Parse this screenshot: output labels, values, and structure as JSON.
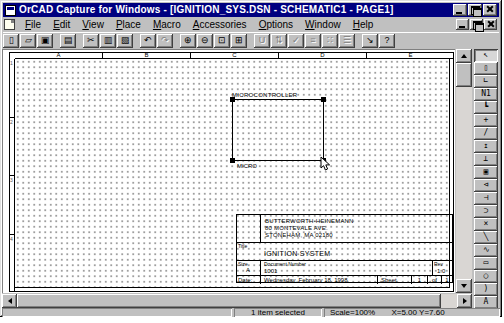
{
  "window": {
    "title": "OrCAD Capture for Windows - [IGNITION_SYS.DSN - SCHEMATIC1 - PAGE1]",
    "control_icons": [
      "minimize",
      "restore",
      "close"
    ]
  },
  "menu": {
    "items": [
      "File",
      "Edit",
      "View",
      "Place",
      "Macro",
      "Accessories",
      "Options",
      "Window",
      "Help"
    ]
  },
  "toolbar": {
    "buttons": [
      {
        "name": "new",
        "glyph": "▯",
        "enabled": true
      },
      {
        "name": "open",
        "glyph": "▱",
        "enabled": true
      },
      {
        "name": "save",
        "glyph": "▣",
        "enabled": true
      },
      {
        "name": "print",
        "glyph": "▤",
        "enabled": true
      },
      {
        "name": "cut",
        "glyph": "✂",
        "enabled": true
      },
      {
        "name": "copy",
        "glyph": "▥",
        "enabled": true
      },
      {
        "name": "paste",
        "glyph": "▧",
        "enabled": true
      },
      {
        "name": "undo",
        "glyph": "↶",
        "enabled": true
      },
      {
        "name": "redo",
        "glyph": "↷",
        "enabled": false
      },
      {
        "name": "zoom-in",
        "glyph": "⊕",
        "enabled": true
      },
      {
        "name": "zoom-out",
        "glyph": "⊖",
        "enabled": true
      },
      {
        "name": "zoom-area",
        "glyph": "⊡",
        "enabled": true
      },
      {
        "name": "zoom-all",
        "glyph": "⊞",
        "enabled": true
      },
      {
        "name": "annotate",
        "glyph": "U",
        "enabled": false
      },
      {
        "name": "back-annotate",
        "glyph": "⇅",
        "enabled": false
      },
      {
        "name": "design-rules-check",
        "glyph": "✓",
        "enabled": false
      },
      {
        "name": "create-netlist",
        "glyph": "≡",
        "enabled": false
      },
      {
        "name": "cross-reference",
        "glyph": "∷",
        "enabled": false
      },
      {
        "name": "bill-of-materials",
        "glyph": "☰",
        "enabled": false
      },
      {
        "name": "snap-to-grid",
        "glyph": "↘",
        "enabled": true
      },
      {
        "name": "help",
        "glyph": "?",
        "enabled": true
      }
    ]
  },
  "palette": {
    "tools": [
      {
        "name": "select",
        "glyph": "↖",
        "selected": true
      },
      {
        "name": "place-part",
        "glyph": "▯",
        "selected": false
      },
      {
        "name": "place-wire",
        "glyph": "∟",
        "selected": false
      },
      {
        "name": "place-net-alias",
        "glyph": "N1",
        "selected": false
      },
      {
        "name": "place-bus",
        "glyph": "┗",
        "selected": false
      },
      {
        "name": "place-junction",
        "glyph": "+",
        "selected": false
      },
      {
        "name": "place-bus-entry",
        "glyph": "/",
        "selected": false
      },
      {
        "name": "place-power",
        "glyph": "↥",
        "selected": false
      },
      {
        "name": "place-ground",
        "glyph": "⊥",
        "selected": false
      },
      {
        "name": "place-hierarchical-block",
        "glyph": "▣",
        "selected": false
      },
      {
        "name": "place-hierarchical-port",
        "glyph": "⊲",
        "selected": false
      },
      {
        "name": "place-hierarchical-pin",
        "glyph": "⊣",
        "selected": false
      },
      {
        "name": "place-off-page-connector",
        "glyph": "⊃",
        "selected": false
      },
      {
        "name": "place-no-connect",
        "glyph": "×",
        "selected": false
      },
      {
        "name": "place-line",
        "glyph": "╲",
        "selected": false
      },
      {
        "name": "place-polyline",
        "glyph": "∿",
        "selected": false
      },
      {
        "name": "place-rectangle",
        "glyph": "▭",
        "selected": false
      },
      {
        "name": "place-ellipse",
        "glyph": "○",
        "selected": false
      },
      {
        "name": "place-arc",
        "glyph": ")",
        "selected": false
      },
      {
        "name": "place-text",
        "glyph": "A",
        "selected": false
      }
    ]
  },
  "canvas": {
    "zones_top": [
      "A",
      "B",
      "C",
      "D",
      "E"
    ],
    "zones_left": [
      "1",
      "2",
      "3",
      "4"
    ],
    "component": {
      "name": "MICROCONTROLLER",
      "reference": "MICRO"
    },
    "title_block": {
      "company_lines": [
        "BUTTERWORTH-HEINEMANN",
        "80 MONTEVALE AVE.",
        "STONEHAM, MA 02180"
      ],
      "title_label": "Title",
      "title_value": "IGNITION SYSTEM",
      "size_label": "Size",
      "size_value": "A",
      "docnum_label": "Document Number",
      "docnum_value": "1001",
      "rev_label": "Rev",
      "rev_value": "1.0",
      "date_label": "Date:",
      "date_value": "Wednesday, February 18, 1998",
      "sheet_label": "Sheet",
      "sheet_number": "1",
      "of_label": "of",
      "sheet_total": "1"
    }
  },
  "statusbar": {
    "selection": "1 item selected",
    "scale": "Scale=100%",
    "coordinates": "X=5.00 Y=7.60"
  },
  "colors": {
    "titlebar": "#000080",
    "chrome": "#c0c0c0",
    "page": "#ffffff",
    "grid_dot": "#9f9f9f",
    "selection_handle": "#000000"
  }
}
